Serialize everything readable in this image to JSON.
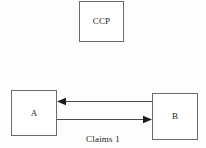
{
  "diagram": {
    "background_color": "#fdfdfc",
    "border_color": "#6b6b6b",
    "line_color": "#4a4a4a",
    "text_color": "#1c1c1c",
    "nodes": [
      {
        "id": "ccp",
        "label": "CCP",
        "x": 79,
        "y": 1,
        "width": 45,
        "height": 41
      },
      {
        "id": "a",
        "label": "A",
        "x": 11,
        "y": 90,
        "width": 46,
        "height": 46
      },
      {
        "id": "b",
        "label": "B",
        "x": 152,
        "y": 93,
        "width": 46,
        "height": 47
      }
    ],
    "edges": [
      {
        "id": "b-to-a",
        "from": "b",
        "to": "a",
        "direction": "left",
        "arrowhead": "at-a",
        "y": 101
      },
      {
        "id": "a-to-b",
        "from": "a",
        "to": "b",
        "direction": "right",
        "arrowhead": "at-b",
        "y": 119
      }
    ],
    "edge_caption": "Claims 1"
  }
}
